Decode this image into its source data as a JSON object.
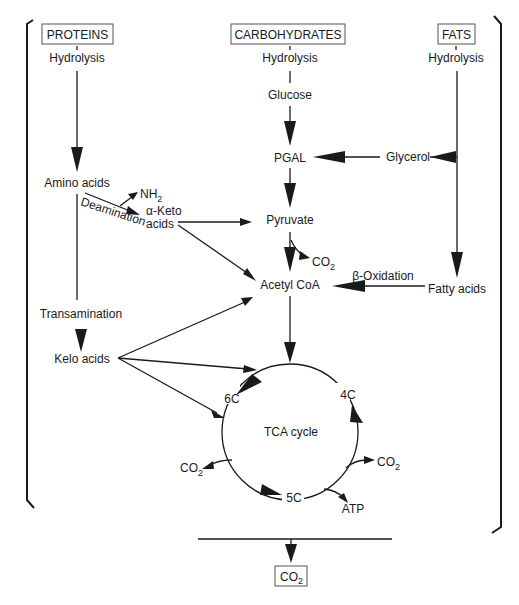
{
  "diagram": {
    "sources": {
      "proteins": "PROTEINS",
      "carbohydrates": "CARBOHYDRATES",
      "fats": "FATS"
    },
    "steps": {
      "hydrolysis_proteins": "Hydrolysis",
      "hydrolysis_carbs": "Hydrolysis",
      "hydrolysis_fats": "Hydrolysis",
      "glucose": "Glucose",
      "pgal": "PGAL",
      "glycerol": "Glycerol",
      "amino_acids": "Amino acids",
      "nh2": "NH",
      "nh2_sub": "2",
      "deamination": "Deamination",
      "alpha_keto_line1": "α-Keto",
      "alpha_keto_line2": "acids",
      "pyruvate": "Pyruvate",
      "co2_pyruvate": "CO",
      "co2_pyruvate_sub": "2",
      "acetyl_coa": "Acetyl CoA",
      "beta_oxidation": "β-Oxidation",
      "fatty_acids": "Fatty acids",
      "transamination": "Transamination",
      "kelo_acids": "Kelo acids",
      "tca_cycle": "TCA cycle",
      "c6": "6C",
      "c4": "4C",
      "c5": "5C",
      "co2_left": "CO",
      "co2_left_sub": "2",
      "co2_right": "CO",
      "co2_right_sub": "2",
      "atp": "ATP",
      "co2_final": "CO",
      "co2_final_sub": "2"
    },
    "colors": {
      "ink": "#1a1a1a",
      "box_border": "#555555",
      "background": "#ffffff"
    }
  }
}
